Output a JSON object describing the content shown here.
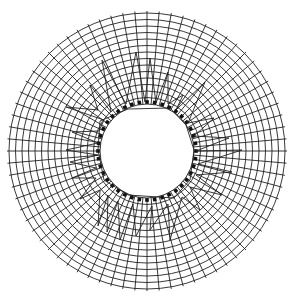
{
  "diagram": {
    "title": "Radial mesh around circular opening with displacement polyline",
    "canvas": {
      "width": 291,
      "height": 302,
      "background": "#ffffff"
    },
    "mesh": {
      "center": [
        147,
        151
      ],
      "outer_radius": 138,
      "inner_radius": 47,
      "rings": 14,
      "radial_lines": 72,
      "line_color": "#222222",
      "line_width": 0.9
    },
    "boundary_markers": {
      "count": 40,
      "radius": 49,
      "size": 3.6,
      "color": "#111111"
    },
    "inner_polygon": {
      "color": "#222222",
      "points": [
        [
          100,
          121
        ],
        [
          128,
          109
        ],
        [
          170,
          108
        ],
        [
          186,
          125
        ],
        [
          194,
          150
        ],
        [
          190,
          180
        ],
        [
          174,
          198
        ],
        [
          128,
          195
        ],
        [
          104,
          180
        ],
        [
          98,
          150
        ]
      ]
    },
    "jagged_line": {
      "color": "#222222",
      "points": [
        [
          104,
          120
        ],
        [
          66,
          107
        ],
        [
          98,
          110
        ],
        [
          90,
          85
        ],
        [
          111,
          112
        ],
        [
          102,
          60
        ],
        [
          126,
          104
        ],
        [
          136,
          52
        ],
        [
          145,
          102
        ],
        [
          150,
          58
        ],
        [
          156,
          103
        ],
        [
          168,
          72
        ],
        [
          168,
          104
        ],
        [
          183,
          95
        ],
        [
          176,
          110
        ],
        [
          205,
          82
        ],
        [
          188,
          123
        ],
        [
          214,
          118
        ],
        [
          194,
          136
        ],
        [
          229,
          138
        ],
        [
          196,
          151
        ],
        [
          242,
          150
        ],
        [
          198,
          164
        ],
        [
          232,
          172
        ],
        [
          196,
          175
        ],
        [
          222,
          195
        ],
        [
          190,
          187
        ],
        [
          200,
          210
        ],
        [
          182,
          197
        ],
        [
          170,
          240
        ],
        [
          168,
          204
        ],
        [
          150,
          230
        ],
        [
          152,
          206
        ],
        [
          136,
          236
        ],
        [
          133,
          204
        ],
        [
          120,
          240
        ],
        [
          118,
          201
        ],
        [
          107,
          232
        ],
        [
          108,
          195
        ],
        [
          98,
          226
        ],
        [
          100,
          190
        ],
        [
          80,
          199
        ],
        [
          96,
          178
        ],
        [
          72,
          178
        ],
        [
          96,
          168
        ],
        [
          70,
          162
        ],
        [
          98,
          155
        ],
        [
          66,
          150
        ],
        [
          98,
          143
        ],
        [
          72,
          132
        ],
        [
          99,
          131
        ],
        [
          104,
          120
        ]
      ]
    }
  }
}
